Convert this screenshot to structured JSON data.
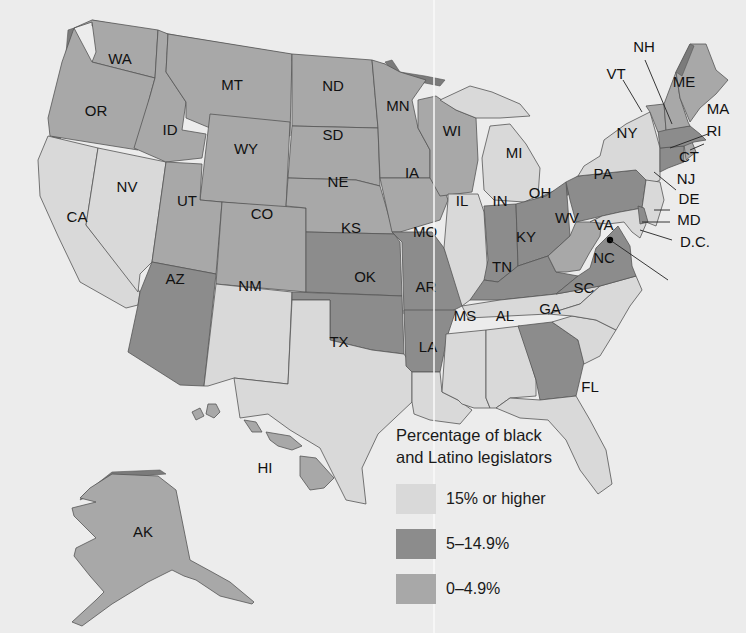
{
  "legend": {
    "title_line1": "Percentage of black",
    "title_line2": "and Latino legislators",
    "items": [
      {
        "label": "15% or higher",
        "key": "high",
        "color": "#d9d9d9"
      },
      {
        "label": "5–14.9%",
        "key": "mid",
        "color": "#8c8c8c"
      },
      {
        "label": "0–4.9%",
        "key": "low",
        "color": "#a8a8a8"
      }
    ]
  },
  "colors": {
    "high": "#d9d9d9",
    "mid": "#8c8c8c",
    "low": "#a8a8a8",
    "background": "#ececec",
    "coast_shadow": "#7b7b7b"
  },
  "states": {
    "WA": {
      "label": "WA",
      "category": "low"
    },
    "OR": {
      "label": "OR",
      "category": "low"
    },
    "CA": {
      "label": "CA",
      "category": "high"
    },
    "NV": {
      "label": "NV",
      "category": "high"
    },
    "ID": {
      "label": "ID",
      "category": "low"
    },
    "MT": {
      "label": "MT",
      "category": "low"
    },
    "WY": {
      "label": "WY",
      "category": "low"
    },
    "UT": {
      "label": "UT",
      "category": "low"
    },
    "CO": {
      "label": "CO",
      "category": "low"
    },
    "AZ": {
      "label": "AZ",
      "category": "mid"
    },
    "NM": {
      "label": "NM",
      "category": "high"
    },
    "ND": {
      "label": "ND",
      "category": "low"
    },
    "SD": {
      "label": "SD",
      "category": "low"
    },
    "NE": {
      "label": "NE",
      "category": "low"
    },
    "KS": {
      "label": "KS",
      "category": "mid"
    },
    "OK": {
      "label": "OK",
      "category": "mid"
    },
    "TX": {
      "label": "TX",
      "category": "high"
    },
    "MN": {
      "label": "MN",
      "category": "low"
    },
    "IA": {
      "label": "IA",
      "category": "low"
    },
    "MO": {
      "label": "MO",
      "category": "mid"
    },
    "AR": {
      "label": "AR",
      "category": "mid"
    },
    "LA": {
      "label": "LA",
      "category": "high"
    },
    "WI": {
      "label": "WI",
      "category": "low"
    },
    "IL": {
      "label": "IL",
      "category": "high"
    },
    "MI": {
      "label": "MI",
      "category": "high"
    },
    "IN": {
      "label": "IN",
      "category": "mid"
    },
    "OH": {
      "label": "OH",
      "category": "mid"
    },
    "KY": {
      "label": "KY",
      "category": "mid"
    },
    "TN": {
      "label": "TN",
      "category": "high"
    },
    "MS": {
      "label": "MS",
      "category": "high"
    },
    "AL": {
      "label": "AL",
      "category": "high"
    },
    "GA": {
      "label": "GA",
      "category": "mid"
    },
    "FL": {
      "label": "FL",
      "category": "high"
    },
    "SC": {
      "label": "SC",
      "category": "high"
    },
    "NC": {
      "label": "NC",
      "category": "high"
    },
    "VA": {
      "label": "VA",
      "category": "mid"
    },
    "WV": {
      "label": "WV",
      "category": "low"
    },
    "PA": {
      "label": "PA",
      "category": "mid"
    },
    "NY": {
      "label": "NY",
      "category": "high"
    },
    "NJ": {
      "label": "NJ",
      "category": "high"
    },
    "DE": {
      "label": "DE",
      "category": "mid"
    },
    "MD": {
      "label": "MD",
      "category": "high"
    },
    "DC": {
      "label": "D.C.",
      "category": "mid"
    },
    "CT": {
      "label": "CT",
      "category": "mid"
    },
    "RI": {
      "label": "RI",
      "category": "low"
    },
    "MA": {
      "label": "MA",
      "category": "mid"
    },
    "VT": {
      "label": "VT",
      "category": "low"
    },
    "NH": {
      "label": "NH",
      "category": "low"
    },
    "ME": {
      "label": "ME",
      "category": "low"
    },
    "AK": {
      "label": "AK",
      "category": "low"
    },
    "HI": {
      "label": "HI",
      "category": "low"
    }
  }
}
